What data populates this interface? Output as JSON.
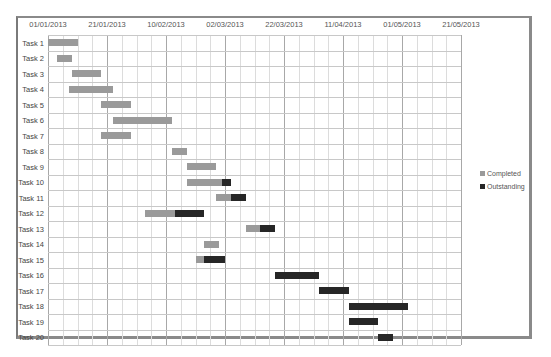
{
  "chart_data": {
    "type": "gantt",
    "title": "",
    "xlabel": "",
    "ylabel": "",
    "x_axis": {
      "start_date": "01/01/2013",
      "tick_labels": [
        "01/01/2013",
        "21/01/2013",
        "10/02/2013",
        "02/03/2013",
        "22/03/2013",
        "11/04/2013",
        "01/05/2013",
        "21/05/2013"
      ],
      "tick_interval_days": 20,
      "minor_interval_days": 5,
      "range_days": [
        0,
        140
      ]
    },
    "grid": true,
    "legend_position": "right",
    "series": [
      {
        "name": "Completed",
        "color": "#9a9a9a"
      },
      {
        "name": "Outstanding",
        "color": "#262626"
      }
    ],
    "tasks": [
      {
        "name": "Task 1",
        "start_day": 0,
        "completed_days": 10,
        "outstanding_days": 0
      },
      {
        "name": "Task 2",
        "start_day": 3,
        "completed_days": 5,
        "outstanding_days": 0
      },
      {
        "name": "Task 3",
        "start_day": 8,
        "completed_days": 10,
        "outstanding_days": 0
      },
      {
        "name": "Task 4",
        "start_day": 7,
        "completed_days": 15,
        "outstanding_days": 0
      },
      {
        "name": "Task 5",
        "start_day": 18,
        "completed_days": 10,
        "outstanding_days": 0
      },
      {
        "name": "Task 6",
        "start_day": 22,
        "completed_days": 20,
        "outstanding_days": 0
      },
      {
        "name": "Task 7",
        "start_day": 18,
        "completed_days": 10,
        "outstanding_days": 0
      },
      {
        "name": "Task 8",
        "start_day": 42,
        "completed_days": 5,
        "outstanding_days": 0
      },
      {
        "name": "Task 9",
        "start_day": 47,
        "completed_days": 10,
        "outstanding_days": 0
      },
      {
        "name": "Task 10",
        "start_day": 47,
        "completed_days": 12,
        "outstanding_days": 3
      },
      {
        "name": "Task 11",
        "start_day": 57,
        "completed_days": 5,
        "outstanding_days": 5
      },
      {
        "name": "Task 12",
        "start_day": 33,
        "completed_days": 10,
        "outstanding_days": 10
      },
      {
        "name": "Task 13",
        "start_day": 67,
        "completed_days": 5,
        "outstanding_days": 5
      },
      {
        "name": "Task 14",
        "start_day": 53,
        "completed_days": 5,
        "outstanding_days": 0
      },
      {
        "name": "Task 15",
        "start_day": 50,
        "completed_days": 3,
        "outstanding_days": 7
      },
      {
        "name": "Task 16",
        "start_day": 77,
        "completed_days": 0,
        "outstanding_days": 15
      },
      {
        "name": "Task 17",
        "start_day": 92,
        "completed_days": 0,
        "outstanding_days": 10
      },
      {
        "name": "Task 18",
        "start_day": 102,
        "completed_days": 0,
        "outstanding_days": 20
      },
      {
        "name": "Task 19",
        "start_day": 102,
        "completed_days": 0,
        "outstanding_days": 10
      },
      {
        "name": "Task 20",
        "start_day": 112,
        "completed_days": 0,
        "outstanding_days": 5
      }
    ]
  },
  "legend": {
    "completed_label": "Completed",
    "outstanding_label": "Outstanding"
  }
}
